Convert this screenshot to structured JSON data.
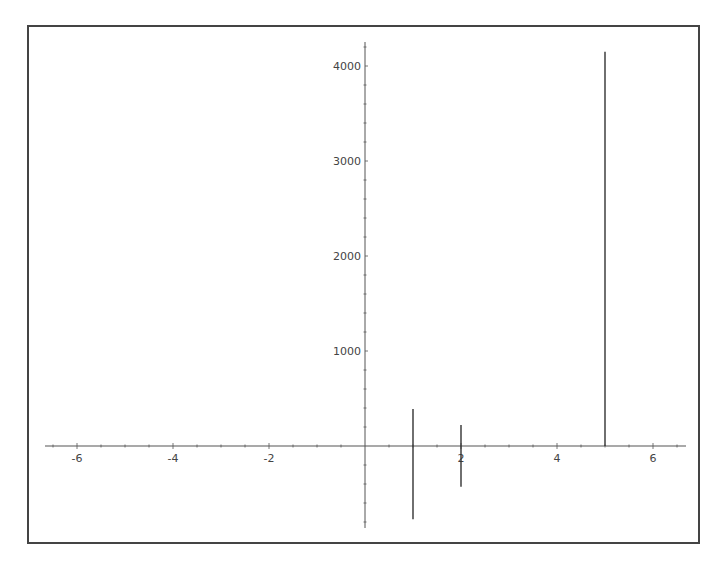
{
  "chart_data": {
    "type": "line",
    "subtype": "vertical-segments",
    "title": "",
    "xlabel": "",
    "ylabel": "",
    "xlim": [
      -6.6,
      6.5
    ],
    "ylim": [
      -870,
      4250
    ],
    "grid": false,
    "legend": null,
    "x_ticks": [
      -6,
      -4,
      -2,
      2,
      4,
      6
    ],
    "x_tick_labels": [
      "-6",
      "-4",
      "-2",
      "2",
      "4",
      "6"
    ],
    "y_ticks": [
      1000,
      2000,
      3000,
      4000
    ],
    "y_tick_labels": [
      "1000",
      "2000",
      "3000",
      "4000"
    ],
    "series": [
      {
        "name": "segment at x=1",
        "x": 1,
        "y_min": -770,
        "y_max": 390
      },
      {
        "name": "segment at x=2",
        "x": 2,
        "y_min": -430,
        "y_max": 220
      },
      {
        "name": "segment at x=5",
        "x": 5,
        "y_min": 0,
        "y_max": 4150
      }
    ],
    "colors": {
      "axis": "#555555",
      "line": "#333333",
      "frame": "#444444"
    }
  }
}
